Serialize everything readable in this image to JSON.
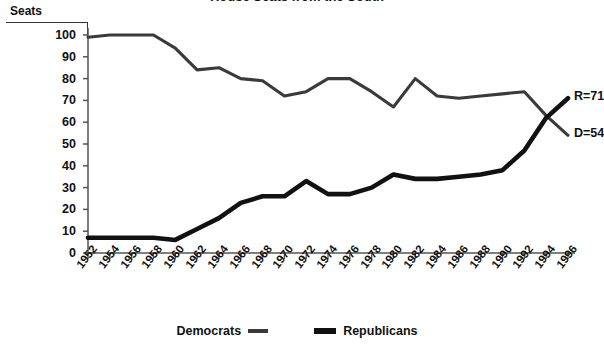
{
  "title": "House Seats from the South",
  "axis": {
    "y_label": "Seats",
    "y_ticks": [
      "0",
      "10",
      "20",
      "30",
      "40",
      "50",
      "60",
      "70",
      "80",
      "90",
      "100"
    ]
  },
  "end_labels": {
    "republican": "R=71",
    "democrat": "D=54"
  },
  "legend": {
    "democrats": "Democrats",
    "republicans": "Republicans"
  },
  "colors": {
    "democrat_line": "#3a3a3a",
    "republican_line": "#111111",
    "axis": "#555555",
    "text": "#111111"
  },
  "chart_data": {
    "type": "line",
    "title": "House Seats from the South",
    "xlabel": "",
    "ylabel": "Seats",
    "ylim": [
      0,
      100
    ],
    "xlim": [
      "1952",
      "1996"
    ],
    "grid": false,
    "legend_position": "bottom",
    "annotations": [
      "R=71",
      "D=54"
    ],
    "x": [
      "1952",
      "1954",
      "1956",
      "1958",
      "1960",
      "1962",
      "1964",
      "1966",
      "1968",
      "1970",
      "1972",
      "1974",
      "1976",
      "1978",
      "1980",
      "1982",
      "1984",
      "1986",
      "1988",
      "1990",
      "1992",
      "1994",
      "1996"
    ],
    "series": [
      {
        "name": "Democrats",
        "style": "thin",
        "values": [
          99,
          100,
          100,
          100,
          94,
          84,
          85,
          80,
          79,
          72,
          74,
          80,
          80,
          74,
          67,
          80,
          72,
          71,
          72,
          73,
          74,
          63,
          54
        ]
      },
      {
        "name": "Republicans",
        "style": "thick",
        "values": [
          7,
          7,
          7,
          7,
          6,
          11,
          16,
          23,
          26,
          26,
          33,
          27,
          27,
          30,
          36,
          34,
          34,
          35,
          36,
          38,
          47,
          62,
          71
        ]
      }
    ]
  }
}
